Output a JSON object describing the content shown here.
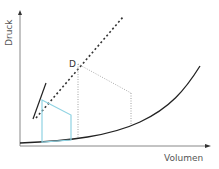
{
  "diagram": {
    "type": "pressure-volume diagram",
    "y_axis_label": "Druck",
    "x_axis_label": "Volumen",
    "point_label": "D",
    "colors": {
      "axis": "#888888",
      "curve": "#222222",
      "dashed_line": "#333333",
      "steep_line": "#222222",
      "dotted_guides": "#888888",
      "highlight_polygon": "#8fd3e3",
      "text": "#555555"
    },
    "elements": [
      {
        "name": "coexistence-curve",
        "style": "solid"
      },
      {
        "name": "tangent-dashed-line",
        "style": "dashed"
      },
      {
        "name": "steep-solid-line",
        "style": "solid"
      },
      {
        "name": "guide-lines",
        "style": "dotted"
      },
      {
        "name": "cycle-polygon",
        "style": "solid-blue"
      }
    ]
  }
}
